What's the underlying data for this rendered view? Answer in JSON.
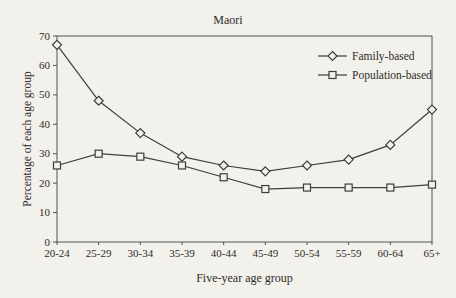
{
  "chart_data": {
    "type": "line",
    "title": "Maori",
    "xlabel": "Five-year age group",
    "ylabel": "Percentage of each age group",
    "categories": [
      "20-24",
      "25-29",
      "30-34",
      "35-39",
      "40-44",
      "45-49",
      "50-54",
      "55-59",
      "60-64",
      "65+"
    ],
    "series": [
      {
        "name": "Family-based",
        "marker": "diamond",
        "values": [
          67,
          48,
          37,
          29,
          26,
          24,
          26,
          28,
          33,
          45
        ]
      },
      {
        "name": "Population-based",
        "marker": "square",
        "values": [
          26,
          30,
          29,
          26,
          22,
          18,
          18.5,
          18.5,
          18.5,
          19.5
        ]
      }
    ],
    "ylim": [
      0,
      70
    ],
    "ytick_step": 10,
    "grid": false,
    "legend_position": "top-right-inside"
  },
  "colors": {
    "background": "#f3f1ec",
    "line": "#3f3d3a",
    "border": "#55524d",
    "text": "#2e2c28"
  }
}
